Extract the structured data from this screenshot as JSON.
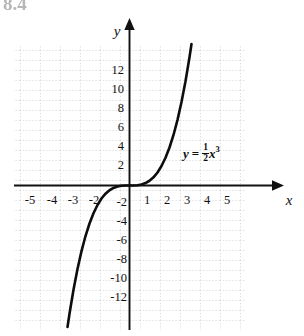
{
  "figure": {
    "corner_label": "8.4",
    "background_color": "#ffffff",
    "curve_color": "#0d0d0d",
    "axis_color": "#111111",
    "grid_color": "#d9d9d9"
  },
  "axes": {
    "x_axis_name": "x",
    "y_axis_name": "y",
    "x_tick_labels": [
      "-5",
      "-4",
      "-3",
      "-2",
      "1",
      "2",
      "3",
      "4",
      "5"
    ],
    "y_tick_labels": [
      "12",
      "10",
      "8",
      "6",
      "4",
      "2",
      "-2",
      "-4",
      "-6",
      "-8",
      "-10",
      "-12"
    ]
  },
  "equation": {
    "lhs": "y",
    "equals": "=",
    "numerator": "1",
    "denominator": "2",
    "variable": "x",
    "exponent": "3"
  },
  "chart_data": {
    "type": "line",
    "title": "",
    "xlabel": "x",
    "ylabel": "y",
    "function": "y = (1/2)x^3",
    "coefficient": 0.5,
    "exponent": 3,
    "xlim": [
      -5.75,
      5.75
    ],
    "ylim": [
      -14,
      14
    ],
    "x_ticks": [
      -5,
      -4,
      -3,
      -2,
      1,
      2,
      3,
      4,
      5
    ],
    "y_ticks": [
      12,
      10,
      8,
      6,
      4,
      2,
      -2,
      -4,
      -6,
      -8,
      -10,
      -12
    ],
    "grid": true,
    "grid_style": "dotted",
    "legend": "none",
    "annotations": [
      {
        "text": "y = 1/2 x^3",
        "x": 2.7,
        "y": 3.2
      }
    ],
    "x": [
      -3.1,
      -3.0,
      -2.8,
      -2.6,
      -2.4,
      -2.2,
      -2.0,
      -1.8,
      -1.6,
      -1.4,
      -1.2,
      -1.0,
      -0.8,
      -0.6,
      -0.4,
      -0.2,
      0.0,
      0.2,
      0.4,
      0.6,
      0.8,
      1.0,
      1.2,
      1.4,
      1.6,
      1.8,
      2.0,
      2.2,
      2.4,
      2.6,
      2.8,
      3.0,
      3.1
    ],
    "y": [
      -14.89,
      -13.5,
      -10.98,
      -8.79,
      -6.91,
      -5.32,
      -4.0,
      -2.92,
      -2.05,
      -1.37,
      -0.86,
      -0.5,
      -0.26,
      -0.11,
      -0.03,
      -0.004,
      0.0,
      0.004,
      0.03,
      0.11,
      0.26,
      0.5,
      0.86,
      1.37,
      2.05,
      2.92,
      4.0,
      5.32,
      6.91,
      8.79,
      10.98,
      13.5,
      14.89
    ]
  }
}
